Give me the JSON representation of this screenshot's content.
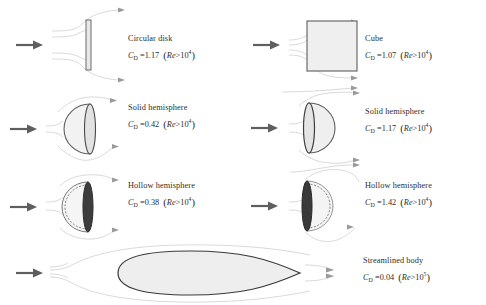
{
  "figure": {
    "colors": {
      "stream_line": "#c9c9c9",
      "arrow": "#6b6b6b",
      "body_outline": "#5a5a5a",
      "body_fill": "#f0f0f0",
      "dark_rim": "#3c3c3c",
      "text": "#2e2e2e"
    },
    "symbols": {
      "cd": "C",
      "cd_subscript": "D",
      "equals": "=",
      "re": "Re",
      "greater": ">",
      "base": "10",
      "paren_open": "(",
      "paren_close": ")"
    }
  },
  "items": [
    {
      "id": "circular-disk",
      "shape": "circular-disk",
      "column": "left",
      "row": 1,
      "name": "Circular disk",
      "cd_value": "1.17",
      "re_exponent": "4"
    },
    {
      "id": "cube",
      "shape": "cube",
      "column": "right",
      "row": 1,
      "name": "Cube",
      "cd_value": "1.07",
      "re_exponent": "4"
    },
    {
      "id": "solid-hemisphere-dome-upstream",
      "shape": "solid-hemisphere-curved-front",
      "column": "left",
      "row": 2,
      "name": "Solid hemisphere",
      "cd_value": "0.42",
      "re_exponent": "4"
    },
    {
      "id": "solid-hemisphere-flat-upstream",
      "shape": "solid-hemisphere-flat-front",
      "column": "right",
      "row": 2,
      "name": "Solid hemisphere",
      "cd_value": "1.17",
      "re_exponent": "4"
    },
    {
      "id": "hollow-hemisphere-dome-upstream",
      "shape": "hollow-hemisphere-curved-front",
      "column": "left",
      "row": 3,
      "name": "Hollow hemisphere",
      "cd_value": "0.38",
      "re_exponent": "4"
    },
    {
      "id": "hollow-hemisphere-open-upstream",
      "shape": "hollow-hemisphere-open-front",
      "column": "right",
      "row": 3,
      "name": "Hollow hemisphere",
      "cd_value": "1.42",
      "re_exponent": "4"
    },
    {
      "id": "streamlined-body",
      "shape": "streamlined-body",
      "column": "full",
      "row": 4,
      "name": "Streamlined body",
      "cd_value": "0.04",
      "re_exponent": "5"
    }
  ]
}
